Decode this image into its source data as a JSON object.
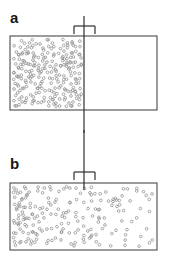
{
  "figure": {
    "type": "scientific-diagram",
    "width": 170,
    "height": 265,
    "background_color": "#ffffff"
  },
  "panels": [
    {
      "id": "a",
      "label": "a",
      "label_position": {
        "x": 10,
        "y": 10
      },
      "caption_state": "partition-in-place",
      "container": {
        "x": 10,
        "y": 36,
        "width": 147,
        "height": 74,
        "stroke_color": "#4a4a4a",
        "stroke_width": 1.1,
        "fill": "none"
      },
      "partition": {
        "present": true,
        "x": 84,
        "top_y": 16,
        "bottom_y": 133,
        "stroke_color": "#2f2f2f",
        "stroke_width": 1.2,
        "flange": {
          "y": 26,
          "left_x": 74,
          "right_x": 95,
          "drop": 8
        }
      },
      "gas_region": {
        "x": 11,
        "y": 37,
        "width": 73,
        "height": 72,
        "particle_count": 240,
        "distribution": "uniform-left-half"
      }
    },
    {
      "id": "b",
      "label": "b",
      "label_position": {
        "x": 10,
        "y": 156
      },
      "caption_state": "partition-withdrawn",
      "container": {
        "x": 10,
        "y": 183,
        "width": 147,
        "height": 67,
        "stroke_color": "#4a4a4a",
        "stroke_width": 1.1,
        "fill": "none"
      },
      "partition": {
        "present": false,
        "x": 84,
        "top_y": 130,
        "bottom_y": 190,
        "stroke_color": "#2f2f2f",
        "stroke_width": 1.2,
        "flange": {
          "y": 172,
          "left_x": 74,
          "right_x": 95,
          "drop": 8
        }
      },
      "gas_region": {
        "x": 11,
        "y": 184,
        "width": 145,
        "height": 65,
        "particle_count": 195,
        "distribution": "gradient-dense-left-to-sparse-right"
      }
    }
  ],
  "particle_style": {
    "shape": "open-circle",
    "radius": 1.35,
    "stroke_color": "#8e8e8e",
    "stroke_width": 0.75,
    "fill": "none"
  },
  "colors": {
    "box_stroke": "#4a4a4a",
    "rod_stroke": "#2f2f2f",
    "particle_stroke": "#8e8e8e",
    "label_text": "#151515",
    "background": "#ffffff"
  }
}
